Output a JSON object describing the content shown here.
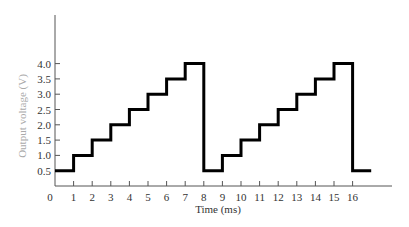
{
  "chart_data": {
    "type": "line",
    "title": "",
    "xlabel": "Time (ms)",
    "ylabel": "Output voltage (V)",
    "xlim": [
      0,
      18
    ],
    "ylim": [
      0,
      4.4
    ],
    "grid": false,
    "legend": null,
    "x_ticks": [
      0,
      1,
      2,
      3,
      4,
      5,
      6,
      7,
      8,
      9,
      10,
      11,
      12,
      13,
      14,
      15,
      16
    ],
    "y_ticks": [
      0.5,
      1.0,
      1.5,
      2.0,
      2.5,
      3.0,
      3.5,
      4.0
    ],
    "y_tick_labels": [
      "0.5",
      "1.0",
      "1.5",
      "2.0",
      "2.5",
      "3.0",
      "3.5",
      "4.0"
    ],
    "series": [
      {
        "name": "Staircase output",
        "step": "post",
        "x": [
          0,
          1,
          2,
          3,
          4,
          5,
          6,
          7,
          8,
          9,
          10,
          11,
          12,
          13,
          14,
          15,
          16,
          17
        ],
        "values": [
          0.5,
          1.0,
          1.5,
          2.0,
          2.5,
          3.0,
          3.5,
          4.0,
          0.5,
          1.0,
          1.5,
          2.0,
          2.5,
          3.0,
          3.5,
          4.0,
          0.5,
          0.5
        ]
      }
    ],
    "colors": {
      "line": "#000000",
      "axis": "#555555",
      "ylabel": "#aaaaaa"
    }
  }
}
